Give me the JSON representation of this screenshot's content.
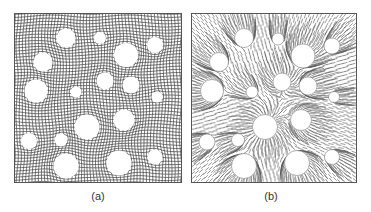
{
  "figure": {
    "panels": [
      {
        "id": "a",
        "label": "(a)",
        "description": "distorted structured grid mesh around circular inclusions",
        "frame": {
          "x": 14,
          "y": 13,
          "w": 168,
          "h": 170
        },
        "line_color": "#444444",
        "background": "#ffffff",
        "grid_spacing": 3.2,
        "circles": [
          {
            "cx": 66,
            "cy": 38,
            "r": 9.5
          },
          {
            "cx": 100,
            "cy": 38,
            "r": 6
          },
          {
            "cx": 155,
            "cy": 45,
            "r": 8
          },
          {
            "cx": 126,
            "cy": 55,
            "r": 12
          },
          {
            "cx": 43,
            "cy": 62,
            "r": 9.5
          },
          {
            "cx": 105,
            "cy": 81,
            "r": 8.5
          },
          {
            "cx": 131,
            "cy": 85,
            "r": 8.5
          },
          {
            "cx": 36,
            "cy": 91,
            "r": 11.5
          },
          {
            "cx": 76,
            "cy": 92,
            "r": 5.5
          },
          {
            "cx": 157,
            "cy": 97,
            "r": 5.5
          },
          {
            "cx": 124,
            "cy": 120,
            "r": 10.5
          },
          {
            "cx": 87,
            "cy": 127,
            "r": 12.5
          },
          {
            "cx": 29,
            "cy": 141,
            "r": 8
          },
          {
            "cx": 61,
            "cy": 140,
            "r": 6.5
          },
          {
            "cx": 155,
            "cy": 157,
            "r": 7.5
          },
          {
            "cx": 119,
            "cy": 163,
            "r": 12.5
          },
          {
            "cx": 66,
            "cy": 166,
            "r": 12.5
          }
        ]
      },
      {
        "id": "b",
        "label": "(b)",
        "description": "radial streamline / fibre pattern emanating from circular inclusions",
        "frame": {
          "x": 191,
          "y": 13,
          "w": 166,
          "h": 170
        },
        "line_color": "#555555",
        "background": "#ffffff",
        "circles": [
          {
            "cx": 244,
            "cy": 38,
            "r": 9.5
          },
          {
            "cx": 278,
            "cy": 39,
            "r": 6
          },
          {
            "cx": 332,
            "cy": 46,
            "r": 8
          },
          {
            "cx": 303,
            "cy": 56,
            "r": 12
          },
          {
            "cx": 219,
            "cy": 62,
            "r": 9.5
          },
          {
            "cx": 282,
            "cy": 82,
            "r": 9
          },
          {
            "cx": 308,
            "cy": 86,
            "r": 9
          },
          {
            "cx": 212,
            "cy": 91,
            "r": 11.5
          },
          {
            "cx": 252,
            "cy": 92,
            "r": 6
          },
          {
            "cx": 334,
            "cy": 97,
            "r": 5.5
          },
          {
            "cx": 301,
            "cy": 120,
            "r": 10.5
          },
          {
            "cx": 265,
            "cy": 127,
            "r": 12.5
          },
          {
            "cx": 207,
            "cy": 142,
            "r": 8
          },
          {
            "cx": 238,
            "cy": 140,
            "r": 6.5
          },
          {
            "cx": 332,
            "cy": 157,
            "r": 7.5
          },
          {
            "cx": 297,
            "cy": 163,
            "r": 12.5
          },
          {
            "cx": 244,
            "cy": 166,
            "r": 12.5
          }
        ]
      }
    ],
    "captions": [
      {
        "text": "(a)",
        "cx": 98,
        "y": 190
      },
      {
        "text": "(b)",
        "cx": 271,
        "y": 190
      }
    ]
  }
}
